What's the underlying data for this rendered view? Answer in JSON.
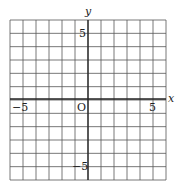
{
  "diagram": {
    "type": "coordinate-grid",
    "x_axis_label": "x",
    "y_axis_label": "y",
    "origin_label": "O",
    "x_range": [
      -6,
      6
    ],
    "y_range": [
      -6,
      6
    ],
    "grid_step": 1,
    "tick_labels": {
      "x_neg": "−5",
      "x_pos": "5",
      "y_pos": "5",
      "y_neg": "−5"
    },
    "colors": {
      "grid": "#555555",
      "axis": "#222222",
      "text": "#222222",
      "background": "#ffffff"
    }
  }
}
